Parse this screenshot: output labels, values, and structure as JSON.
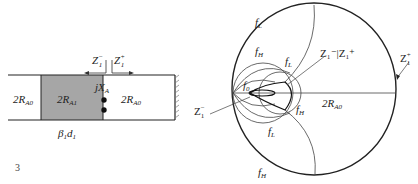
{
  "figure_number": "3",
  "colors": {
    "line": "#222222",
    "section_fill": "#a6a6a6",
    "thin_line": "#555555"
  },
  "transmission_line": {
    "left_section": {
      "label_main": "2R",
      "label_sub": "A0"
    },
    "middle_section": {
      "label_main": "2R",
      "label_sub": "A1"
    },
    "right_section": {
      "label_main": "2R",
      "label_sub": "A0"
    },
    "electrical_length": {
      "main": "β",
      "sub1": "1",
      "d": "d",
      "sub2": "1"
    },
    "reactance": {
      "main": "jX",
      "sub": "A"
    },
    "port_left": {
      "main": "Z",
      "sub": "1",
      "sup": "−"
    },
    "port_right": {
      "main": "Z",
      "sub": "1",
      "sup": "+"
    }
  },
  "smith_chart": {
    "labels": {
      "fL_top": {
        "main": "f",
        "sub": "L"
      },
      "fH_upper": {
        "main": "f",
        "sub": "H"
      },
      "fL_inner": {
        "main": "f",
        "sub": "L"
      },
      "f0": {
        "main": "f",
        "sub": "0"
      },
      "fH_right": {
        "main": "f",
        "sub": "H"
      },
      "fL_lower": {
        "main": "f",
        "sub": "L"
      },
      "fH_bottom": {
        "main": "f",
        "sub": "H"
      },
      "z_match": {
        "text": "Z₁⁻|Z₁⁺"
      },
      "z_plus": {
        "main": "Z",
        "sub": "1",
        "sup": "+"
      },
      "z_minus": {
        "main": "Z",
        "sub": "1",
        "sup": "−"
      },
      "radius": {
        "main": "2R",
        "sub": "A0"
      }
    }
  }
}
